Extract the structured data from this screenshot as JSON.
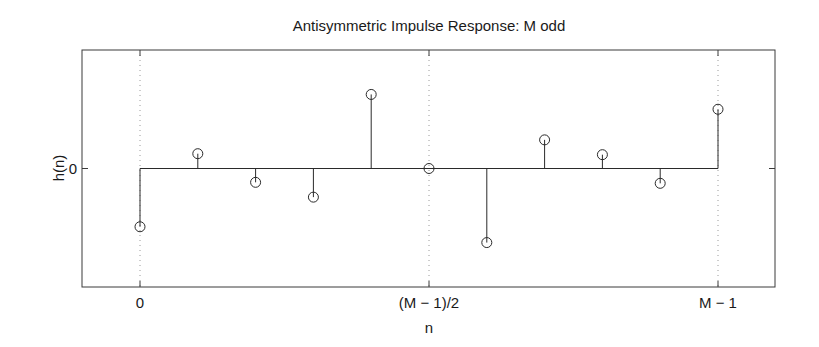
{
  "chart_data": {
    "type": "stem",
    "title": "Antisymmetric Impulse Response: M odd",
    "xlabel": "n",
    "ylabel": "h(n)",
    "x": [
      0,
      1,
      2,
      3,
      4,
      5,
      6,
      7,
      8,
      9,
      10
    ],
    "values": [
      -0.59,
      0.15,
      -0.14,
      -0.29,
      0.75,
      0.0,
      -0.75,
      0.29,
      0.14,
      -0.15,
      0.6
    ],
    "xticks": [
      {
        "pos": 0,
        "label": "0"
      },
      {
        "pos": 5,
        "label": "(M − 1)/2"
      },
      {
        "pos": 10,
        "label": "M − 1"
      }
    ],
    "yticks": [
      {
        "pos": 0,
        "label": "0"
      }
    ],
    "xlim": [
      -1,
      11.0
    ],
    "ylim": [
      -1.2,
      1.2
    ],
    "grid": "dotted vertical lines at x ticks",
    "marker": "open circle",
    "legend": null
  },
  "colors": {
    "line": "#2a2a2a",
    "grid": "#9a9a9a",
    "background": "#ffffff"
  }
}
